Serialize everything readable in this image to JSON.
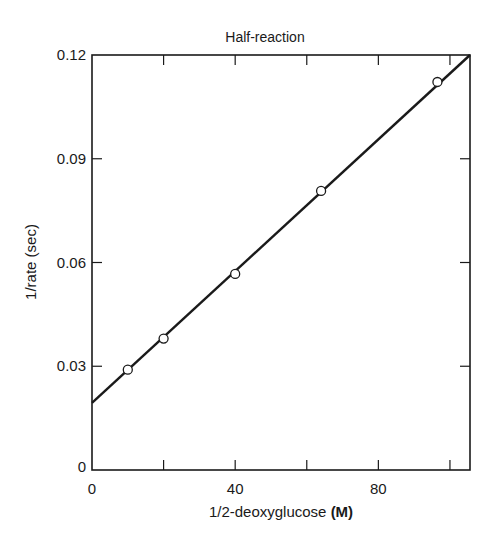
{
  "chart_data": {
    "type": "scatter",
    "title": "Half-reaction",
    "xlabel": "1/2-deoxyglucose",
    "xlabel_unit": "(M)",
    "ylabel": "1/rate (sec)",
    "xlim": [
      0,
      105.6
    ],
    "ylim": [
      0,
      0.12
    ],
    "x_ticks": [
      0,
      20,
      40,
      60,
      80,
      100
    ],
    "x_tick_labels": [
      "0",
      "",
      "40",
      "",
      "80",
      ""
    ],
    "y_ticks": [
      0,
      0.03,
      0.06,
      0.09,
      0.12
    ],
    "y_tick_labels": [
      "0",
      "0.03",
      "0.06",
      "0.09",
      "0.12"
    ],
    "grid": false,
    "legend": null,
    "series": [
      {
        "name": "measured",
        "marker": "open-circle",
        "x": [
          10,
          20,
          40,
          64,
          96.5
        ],
        "y": [
          0.029,
          0.038,
          0.0567,
          0.0807,
          0.1122
        ]
      }
    ],
    "fit_line": {
      "intercept": 0.0194,
      "slope": 0.000953,
      "x_range": [
        0,
        105.6
      ]
    }
  },
  "layout": {
    "plot_left": 92,
    "plot_right": 470,
    "plot_top": 55,
    "plot_bottom": 470,
    "line_color": "#1a1a1a",
    "marker_fill": "#ffffff"
  }
}
